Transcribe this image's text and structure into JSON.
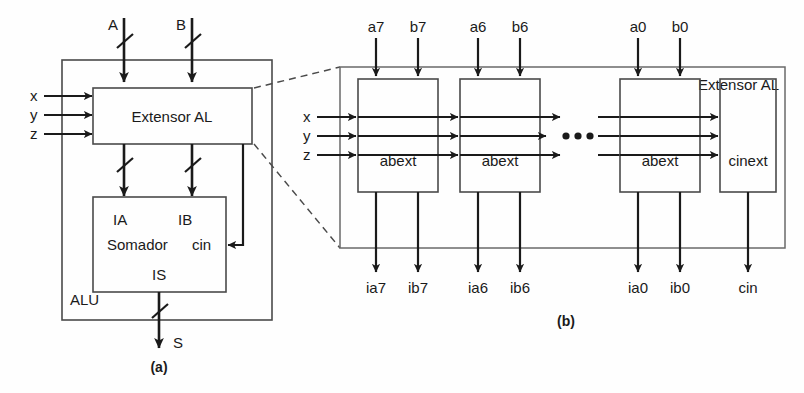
{
  "figure": {
    "caption_a": "(a)",
    "caption_b": "(b)"
  },
  "panel_a": {
    "outer_box_label": "ALU",
    "top_inputs": [
      {
        "name": "A",
        "label": "A"
      },
      {
        "name": "B",
        "label": "B"
      }
    ],
    "side_inputs": [
      {
        "name": "x",
        "label": "x"
      },
      {
        "name": "y",
        "label": "y"
      },
      {
        "name": "z",
        "label": "z"
      }
    ],
    "extensor_box": {
      "label": "Extensor AL"
    },
    "adder_box": {
      "label": "Somador",
      "port_ia": "IA",
      "port_ib": "IB",
      "port_cin": "cin",
      "port_is": "IS"
    },
    "output": {
      "name": "S",
      "label": "S"
    }
  },
  "panel_b": {
    "outer_box_label": "Extensor AL",
    "side_inputs": [
      {
        "name": "x",
        "label": "x"
      },
      {
        "name": "y",
        "label": "y"
      },
      {
        "name": "z",
        "label": "z"
      }
    ],
    "ellipsis": "• • •",
    "slices": [
      {
        "id": "slice-7",
        "block_label": "abext",
        "top_inputs": [
          "a7",
          "b7"
        ],
        "bottom_outputs": [
          "ia7",
          "ib7"
        ]
      },
      {
        "id": "slice-6",
        "block_label": "abext",
        "top_inputs": [
          "a6",
          "b6"
        ],
        "bottom_outputs": [
          "ia6",
          "ib6"
        ]
      },
      {
        "id": "slice-0",
        "block_label": "abext",
        "top_inputs": [
          "a0",
          "b0"
        ],
        "bottom_outputs": [
          "ia0",
          "ib0"
        ]
      }
    ],
    "carry_block": {
      "id": "cinext",
      "block_label": "cinext",
      "bottom_output": "cin"
    }
  },
  "colors": {
    "ink": "#1a1a1a",
    "box_stroke": "#4a4a4a",
    "background": "#fefefe"
  }
}
